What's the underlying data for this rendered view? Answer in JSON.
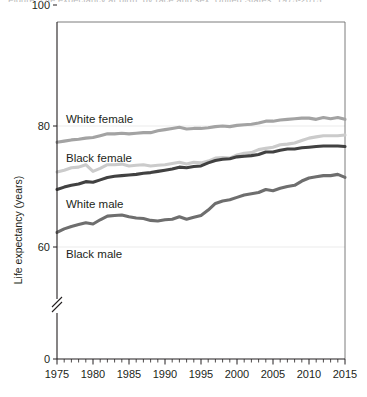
{
  "figure": {
    "cut_caption": "Figure. Life expectancy at birth, by race and sex: United States, 1975-2015",
    "background": "#ffffff"
  },
  "chart_data": {
    "type": "line",
    "title": "",
    "xlabel": "",
    "ylabel": "Life expectancy (years)",
    "xlim": [
      1975,
      2015
    ],
    "ylim": [
      0,
      100
    ],
    "y_axis_break": true,
    "y_break_between": [
      0,
      55
    ],
    "grid": "horizontal-light",
    "legend_position": "inline-labels",
    "y_ticks": [
      0,
      60,
      80,
      100
    ],
    "y_tick_labels": [
      "0",
      "60",
      "80",
      "100"
    ],
    "x_ticks": [
      1975,
      1980,
      1985,
      1990,
      1995,
      2000,
      2005,
      2010,
      2015
    ],
    "x_tick_labels": [
      "1975",
      "1980",
      "1985",
      "1990",
      "1995",
      "2000",
      "2005",
      "2010",
      "2015"
    ],
    "x_minor_tick_interval": 1,
    "x": [
      1975,
      1976,
      1977,
      1978,
      1979,
      1980,
      1981,
      1982,
      1983,
      1984,
      1985,
      1986,
      1987,
      1988,
      1989,
      1990,
      1991,
      1992,
      1993,
      1994,
      1995,
      1996,
      1997,
      1998,
      1999,
      2000,
      2001,
      2002,
      2003,
      2004,
      2005,
      2006,
      2007,
      2008,
      2009,
      2010,
      2011,
      2012,
      2013,
      2014,
      2015
    ],
    "series": [
      {
        "name": "White female",
        "label": "White female",
        "color": "#a3a3a3",
        "values": [
          77.3,
          77.5,
          77.7,
          77.8,
          78.0,
          78.1,
          78.4,
          78.7,
          78.7,
          78.8,
          78.7,
          78.8,
          78.9,
          78.9,
          79.2,
          79.4,
          79.6,
          79.8,
          79.5,
          79.6,
          79.6,
          79.7,
          79.9,
          80.0,
          79.9,
          80.1,
          80.2,
          80.3,
          80.5,
          80.8,
          80.8,
          81.0,
          81.1,
          81.2,
          81.3,
          81.3,
          81.1,
          81.4,
          81.2,
          81.4,
          81.1
        ]
      },
      {
        "name": "Black female",
        "label": "Black female",
        "color": "#cbcbcb",
        "values": [
          72.4,
          72.7,
          73.1,
          73.2,
          73.6,
          72.5,
          73.0,
          73.6,
          73.6,
          73.7,
          73.4,
          73.5,
          73.6,
          73.4,
          73.5,
          73.6,
          73.8,
          74.0,
          73.7,
          74.0,
          73.9,
          74.2,
          74.7,
          74.8,
          74.7,
          75.2,
          75.5,
          75.6,
          76.1,
          76.3,
          76.5,
          76.9,
          77.0,
          77.2,
          77.6,
          78.0,
          78.2,
          78.4,
          78.4,
          78.4,
          78.5
        ]
      },
      {
        "name": "White male",
        "label": "White male",
        "color": "#414141",
        "values": [
          69.5,
          69.9,
          70.2,
          70.4,
          70.8,
          70.7,
          71.1,
          71.5,
          71.7,
          71.8,
          71.9,
          72.0,
          72.2,
          72.3,
          72.5,
          72.7,
          72.9,
          73.2,
          73.1,
          73.3,
          73.4,
          73.9,
          74.3,
          74.5,
          74.6,
          74.9,
          75.0,
          75.1,
          75.3,
          75.7,
          75.7,
          76.0,
          76.2,
          76.2,
          76.4,
          76.5,
          76.6,
          76.7,
          76.7,
          76.7,
          76.6
        ]
      },
      {
        "name": "Black male",
        "label": "Black male",
        "color": "#6e6e6e",
        "values": [
          62.4,
          63.0,
          63.4,
          63.7,
          64.0,
          63.8,
          64.5,
          65.1,
          65.2,
          65.3,
          65.0,
          64.8,
          64.7,
          64.4,
          64.3,
          64.5,
          64.6,
          65.0,
          64.6,
          64.9,
          65.2,
          66.1,
          67.2,
          67.6,
          67.8,
          68.2,
          68.6,
          68.8,
          69.0,
          69.5,
          69.3,
          69.7,
          70.0,
          70.2,
          70.9,
          71.4,
          71.6,
          71.8,
          71.8,
          72.0,
          71.5
        ]
      }
    ],
    "inline_labels": [
      {
        "text": "White female",
        "x_px": 66,
        "y_px": 123
      },
      {
        "text": "Black female",
        "x_px": 66,
        "y_px": 162
      },
      {
        "text": "White male",
        "x_px": 66,
        "y_px": 208
      },
      {
        "text": "Black male",
        "x_px": 66,
        "y_px": 258
      }
    ]
  }
}
